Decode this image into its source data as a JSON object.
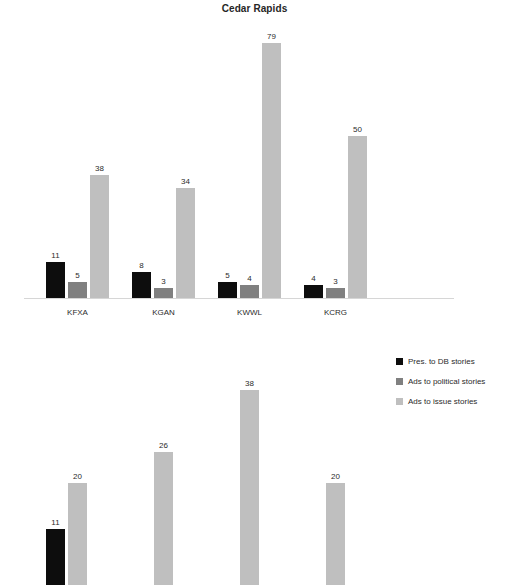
{
  "page": {
    "background": "#ffffff",
    "width": 509,
    "height": 553
  },
  "colors": {
    "series_pres_to_db": "#0d0d0d",
    "series_ads_political": "#808080",
    "series_ads_issue": "#bfbfbf",
    "axis": "#d6d6d6",
    "text": "#2b2b2b"
  },
  "legend": {
    "position": "right",
    "items": [
      {
        "label": "Pres. to DB stories",
        "color": "#0d0d0d"
      },
      {
        "label": "Ads to political stories",
        "color": "#808080"
      },
      {
        "label": "Ads to issue stories",
        "color": "#bfbfbf"
      }
    ]
  },
  "chart_data": [
    {
      "id": "cedar-rapids",
      "type": "bar",
      "title": "Cedar Rapids",
      "xlabel": "",
      "ylabel": "",
      "grid": false,
      "ylim": [
        0,
        86
      ],
      "legend_position": "right",
      "categories": [
        "KFXA",
        "KGAN",
        "KWWL",
        "KCRG"
      ],
      "series": [
        {
          "name": "Pres. to DB stories",
          "color": "#0d0d0d",
          "values": [
            11,
            8,
            5,
            4
          ]
        },
        {
          "name": "Ads to political stories",
          "color": "#808080",
          "values": [
            5,
            3,
            4,
            3
          ]
        },
        {
          "name": "Ads to issue stories",
          "color": "#bfbfbf",
          "values": [
            38,
            34,
            79,
            50
          ]
        }
      ]
    },
    {
      "id": "lower-chart",
      "type": "bar",
      "title": "",
      "xlabel": "",
      "ylabel": "",
      "grid": false,
      "note": "partially visible - cropped at bottom edge of screenshot",
      "ylim": [
        0,
        42
      ],
      "categories": [
        "",
        "",
        "",
        ""
      ],
      "series": [
        {
          "name": "Pres. to DB stories",
          "color": "#0d0d0d",
          "values": [
            11,
            null,
            null,
            null
          ]
        },
        {
          "name": "Ads to issue stories",
          "color": "#bfbfbf",
          "values": [
            20,
            26,
            38,
            20
          ]
        }
      ]
    }
  ]
}
